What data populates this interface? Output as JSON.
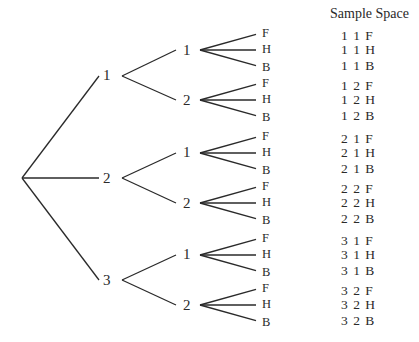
{
  "diagram": {
    "type": "tree",
    "header": "Sample Space",
    "levels": [
      [
        "1",
        "2",
        "3"
      ],
      [
        "1",
        "2"
      ],
      [
        "F",
        "H",
        "B"
      ]
    ],
    "root": {
      "children": [
        {
          "label": "1",
          "children": [
            {
              "label": "1",
              "children": [
                "F",
                "H",
                "B"
              ]
            },
            {
              "label": "2",
              "children": [
                "F",
                "H",
                "B"
              ]
            }
          ]
        },
        {
          "label": "2",
          "children": [
            {
              "label": "1",
              "children": [
                "F",
                "H",
                "B"
              ]
            },
            {
              "label": "2",
              "children": [
                "F",
                "H",
                "B"
              ]
            }
          ]
        },
        {
          "label": "3",
          "children": [
            {
              "label": "1",
              "children": [
                "F",
                "H",
                "B"
              ]
            },
            {
              "label": "2",
              "children": [
                "F",
                "H",
                "B"
              ]
            }
          ]
        }
      ]
    },
    "sample_space": [
      [
        "1 1 F",
        "1 1 H",
        "1 1 B"
      ],
      [
        "1 2 F",
        "1 2 H",
        "1 2 B"
      ],
      [
        "2 1 F",
        "2 1 H",
        "2 1 B"
      ],
      [
        "2 2 F",
        "2 2 H",
        "2 2 B"
      ],
      [
        "3 1 F",
        "3 1 H",
        "3 1 B"
      ],
      [
        "3 2 F",
        "3 2 H",
        "3 2 B"
      ]
    ],
    "colors": {
      "line": "#2a2a2a",
      "text": "#2a2a2a",
      "background": "#ffffff"
    }
  }
}
